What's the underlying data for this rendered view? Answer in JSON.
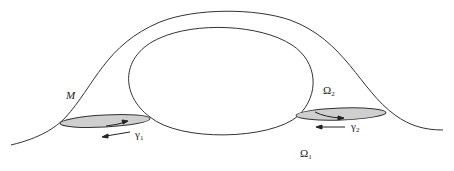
{
  "figure": {
    "labels": {
      "manifold": "M",
      "omega2_base": "Ω",
      "omega2_sub": "2",
      "omega1_base": "Ω",
      "omega1_sub": "1",
      "gamma1_base": "γ",
      "gamma1_sub": "1",
      "gamma2_base": "γ",
      "gamma2_sub": "2"
    },
    "colors": {
      "stroke": "#333333",
      "disc_fill": "#cfcfcf",
      "background": "#ffffff"
    }
  }
}
